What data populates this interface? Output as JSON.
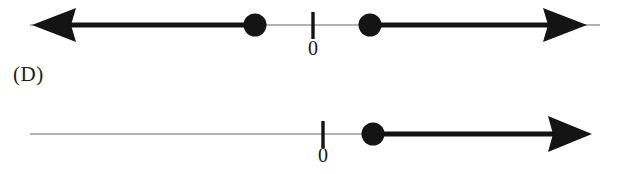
{
  "figure": {
    "title_visible": false,
    "choice_label": "(D)",
    "background_color": "#ffffff",
    "ink_color": "#111111",
    "faint_line_color": "#9a9a9a"
  },
  "number_lines": [
    {
      "id": "top-number-line",
      "axis_y": 25,
      "tick_labels": [
        "0"
      ],
      "tick_positions_px": [
        313
      ],
      "origin_x_px": 313,
      "left_arrow": true,
      "right_arrow": true,
      "left_arrow_tip_px": 32,
      "right_arrow_tip_px": 587,
      "points": [
        {
          "name": "left-closed-point",
          "x_px": 255,
          "filled": true
        },
        {
          "name": "right-closed-point",
          "x_px": 370,
          "filled": true
        }
      ],
      "shaded_segments": [
        {
          "name": "left-ray-shading",
          "from_px": 32,
          "to_px": 255,
          "emphasis": "bold"
        },
        {
          "name": "right-ray-shading",
          "from_px": 370,
          "to_px": 587,
          "emphasis": "bold"
        }
      ],
      "unshaded_segments": [
        {
          "name": "middle-gap",
          "from_px": 255,
          "to_px": 370,
          "emphasis": "faint"
        }
      ]
    },
    {
      "id": "bottom-number-line",
      "axis_y": 134,
      "tick_labels": [
        "0"
      ],
      "tick_positions_px": [
        323
      ],
      "origin_x_px": 323,
      "left_arrow": false,
      "right_arrow": true,
      "left_end_px": 30,
      "right_arrow_tip_px": 592,
      "points": [
        {
          "name": "closed-point",
          "x_px": 373,
          "filled": true
        }
      ],
      "shaded_segments": [
        {
          "name": "right-ray-shading",
          "from_px": 373,
          "to_px": 592,
          "emphasis": "bold"
        }
      ],
      "unshaded_segments": [
        {
          "name": "left-unshaded",
          "from_px": 30,
          "to_px": 373,
          "emphasis": "faint"
        }
      ]
    }
  ],
  "labels": {
    "zero_top": "0",
    "zero_bottom": "0"
  }
}
